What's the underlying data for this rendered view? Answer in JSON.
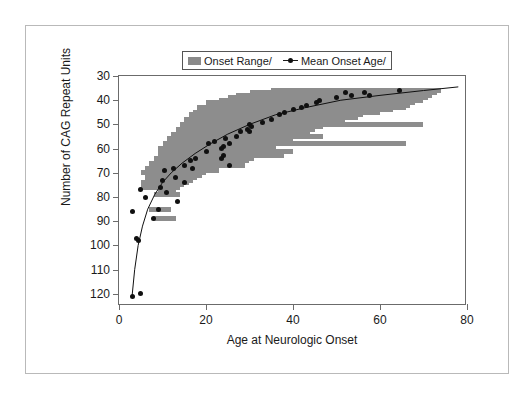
{
  "chart_data": {
    "type": "scatter",
    "title": "",
    "xlabel": "Age at Neurologic Onset",
    "ylabel": "Number of CAG Repeat Units",
    "xlim": [
      0,
      80
    ],
    "ylim": [
      30,
      125
    ],
    "y_inverted": true,
    "grid": false,
    "xticks": [
      0,
      20,
      40,
      60,
      80
    ],
    "yticks": [
      30,
      40,
      50,
      60,
      70,
      80,
      90,
      100,
      110,
      120
    ],
    "legend": {
      "position": "top-center",
      "entries": [
        {
          "label": "Onset Range/",
          "marker": "filled-bar",
          "color": "#8d8d8d"
        },
        {
          "label": "Mean Onset Age/",
          "marker": "line-with-dot",
          "color": "#101010"
        }
      ]
    },
    "series": [
      {
        "name": "Onset Range/",
        "type": "range-bars",
        "color": "#8d8d8d",
        "note": "horizontal bars spanning min-max age of onset at each CAG repeat length",
        "bars": [
          {
            "cag": 36,
            "x_min": 35,
            "x_max": 74
          },
          {
            "cag": 37,
            "x_min": 30,
            "x_max": 73
          },
          {
            "cag": 38,
            "x_min": 27,
            "x_max": 72
          },
          {
            "cag": 39,
            "x_min": 25,
            "x_max": 71
          },
          {
            "cag": 40,
            "x_min": 23,
            "x_max": 70
          },
          {
            "cag": 41,
            "x_min": 20,
            "x_max": 68
          },
          {
            "cag": 42,
            "x_min": 21,
            "x_max": 67
          },
          {
            "cag": 43,
            "x_min": 18,
            "x_max": 66
          },
          {
            "cag": 44,
            "x_min": 19,
            "x_max": 63
          },
          {
            "cag": 45,
            "x_min": 17,
            "x_max": 60
          },
          {
            "cag": 46,
            "x_min": 16,
            "x_max": 56
          },
          {
            "cag": 47,
            "x_min": 17,
            "x_max": 55
          },
          {
            "cag": 48,
            "x_min": 15,
            "x_max": 52
          },
          {
            "cag": 49,
            "x_min": 16,
            "x_max": 48
          },
          {
            "cag": 50,
            "x_min": 14,
            "x_max": 70
          },
          {
            "cag": 51,
            "x_min": 15,
            "x_max": 47
          },
          {
            "cag": 52,
            "x_min": 13,
            "x_max": 45
          },
          {
            "cag": 53,
            "x_min": 14,
            "x_max": 44
          },
          {
            "cag": 54,
            "x_min": 12,
            "x_max": 42
          },
          {
            "cag": 55,
            "x_min": 13,
            "x_max": 47
          },
          {
            "cag": 56,
            "x_min": 11,
            "x_max": 40
          },
          {
            "cag": 57,
            "x_min": 12,
            "x_max": 38
          },
          {
            "cag": 58,
            "x_min": 10,
            "x_max": 66
          },
          {
            "cag": 59,
            "x_min": 11,
            "x_max": 36
          },
          {
            "cag": 60,
            "x_min": 9,
            "x_max": 34
          },
          {
            "cag": 61,
            "x_min": 10,
            "x_max": 40
          },
          {
            "cag": 62,
            "x_min": 9,
            "x_max": 33
          },
          {
            "cag": 63,
            "x_min": 12,
            "x_max": 38
          },
          {
            "cag": 64,
            "x_min": 8,
            "x_max": 31
          },
          {
            "cag": 65,
            "x_min": 9,
            "x_max": 30
          },
          {
            "cag": 66,
            "x_min": 7,
            "x_max": 24
          },
          {
            "cag": 67,
            "x_min": 10,
            "x_max": 29
          },
          {
            "cag": 68,
            "x_min": 6,
            "x_max": 22
          },
          {
            "cag": 69,
            "x_min": 8,
            "x_max": 23
          },
          {
            "cag": 70,
            "x_min": 5,
            "x_max": 20
          },
          {
            "cag": 71,
            "x_min": 7,
            "x_max": 19
          },
          {
            "cag": 72,
            "x_min": 6,
            "x_max": 18
          },
          {
            "cag": 73,
            "x_min": 8,
            "x_max": 17
          },
          {
            "cag": 74,
            "x_min": 5,
            "x_max": 16
          },
          {
            "cag": 75,
            "x_min": 7,
            "x_max": 15
          },
          {
            "cag": 76,
            "x_min": 5,
            "x_max": 14
          },
          {
            "cag": 78,
            "x_min": 9,
            "x_max": 13
          },
          {
            "cag": 79,
            "x_min": 8,
            "x_max": 14
          },
          {
            "cag": 85,
            "x_min": 7,
            "x_max": 12
          },
          {
            "cag": 89,
            "x_min": 8,
            "x_max": 13
          }
        ]
      },
      {
        "name": "Mean Onset Age/",
        "type": "scatter-with-fit",
        "color": "#101010",
        "note": "mean age at onset for each CAG repeat length",
        "points": [
          {
            "age": 64.5,
            "cag": 36
          },
          {
            "age": 52.0,
            "cag": 37
          },
          {
            "age": 56.5,
            "cag": 37
          },
          {
            "age": 53.5,
            "cag": 38
          },
          {
            "age": 57.5,
            "cag": 38
          },
          {
            "age": 50.0,
            "cag": 39
          },
          {
            "age": 46.0,
            "cag": 40
          },
          {
            "age": 45.5,
            "cag": 41
          },
          {
            "age": 43.0,
            "cag": 42
          },
          {
            "age": 42.0,
            "cag": 43
          },
          {
            "age": 40.0,
            "cag": 44
          },
          {
            "age": 38.0,
            "cag": 45
          },
          {
            "age": 37.0,
            "cag": 46
          },
          {
            "age": 35.0,
            "cag": 48
          },
          {
            "age": 33.0,
            "cag": 49
          },
          {
            "age": 30.0,
            "cag": 50
          },
          {
            "age": 30.5,
            "cag": 51
          },
          {
            "age": 29.5,
            "cag": 52
          },
          {
            "age": 28.0,
            "cag": 53
          },
          {
            "age": 30.0,
            "cag": 53
          },
          {
            "age": 27.0,
            "cag": 55
          },
          {
            "age": 24.5,
            "cag": 56
          },
          {
            "age": 22.0,
            "cag": 57
          },
          {
            "age": 25.5,
            "cag": 58
          },
          {
            "age": 20.5,
            "cag": 58
          },
          {
            "age": 24.0,
            "cag": 59
          },
          {
            "age": 23.5,
            "cag": 60
          },
          {
            "age": 20.0,
            "cag": 61
          },
          {
            "age": 24.0,
            "cag": 63
          },
          {
            "age": 23.5,
            "cag": 64
          },
          {
            "age": 17.5,
            "cag": 64
          },
          {
            "age": 16.5,
            "cag": 65
          },
          {
            "age": 25.5,
            "cag": 67
          },
          {
            "age": 15.0,
            "cag": 67
          },
          {
            "age": 17.0,
            "cag": 68
          },
          {
            "age": 12.5,
            "cag": 68
          },
          {
            "age": 10.5,
            "cag": 69
          },
          {
            "age": 13.0,
            "cag": 72
          },
          {
            "age": 10.0,
            "cag": 73
          },
          {
            "age": 15.0,
            "cag": 74
          },
          {
            "age": 9.5,
            "cag": 76
          },
          {
            "age": 5.0,
            "cag": 77
          },
          {
            "age": 11.0,
            "cag": 78
          },
          {
            "age": 6.0,
            "cag": 80
          },
          {
            "age": 13.5,
            "cag": 82
          },
          {
            "age": 3.0,
            "cag": 86
          },
          {
            "age": 9.0,
            "cag": 85
          },
          {
            "age": 8.0,
            "cag": 89
          },
          {
            "age": 4.0,
            "cag": 97
          },
          {
            "age": 4.5,
            "cag": 98
          },
          {
            "age": 3.0,
            "cag": 121
          },
          {
            "age": 5.0,
            "cag": 120
          }
        ],
        "fit_curve": [
          {
            "age": 3.0,
            "cag": 121
          },
          {
            "age": 3.6,
            "cag": 110
          },
          {
            "age": 4.4,
            "cag": 100
          },
          {
            "age": 5.4,
            "cag": 92
          },
          {
            "age": 6.6,
            "cag": 85
          },
          {
            "age": 8.2,
            "cag": 79
          },
          {
            "age": 10.0,
            "cag": 74
          },
          {
            "age": 12.0,
            "cag": 70
          },
          {
            "age": 14.5,
            "cag": 66
          },
          {
            "age": 17.5,
            "cag": 62
          },
          {
            "age": 21.0,
            "cag": 58
          },
          {
            "age": 25.0,
            "cag": 54
          },
          {
            "age": 30.0,
            "cag": 50
          },
          {
            "age": 36.0,
            "cag": 46
          },
          {
            "age": 43.0,
            "cag": 43
          },
          {
            "age": 51.0,
            "cag": 40
          },
          {
            "age": 60.0,
            "cag": 38
          },
          {
            "age": 70.0,
            "cag": 36
          },
          {
            "age": 78.0,
            "cag": 34.5
          }
        ]
      }
    ]
  }
}
